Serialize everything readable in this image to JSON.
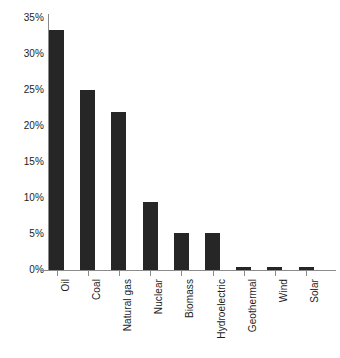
{
  "chart_data": {
    "type": "bar",
    "title": "",
    "subtitle": "",
    "xlabel": "",
    "ylabel": "",
    "categories": [
      "Oil",
      "Coal",
      "Natural gas",
      "Nuclear",
      "Biomass",
      "Hydroelectric",
      "Geothermal",
      "Wind",
      "Solar"
    ],
    "values": [
      33.3,
      25.0,
      22.0,
      9.5,
      5.1,
      5.1,
      0.4,
      0.35,
      0.35
    ],
    "value_suffix": "%",
    "ylim": [
      0,
      35
    ],
    "ytick_values": [
      0,
      5,
      10,
      15,
      20,
      25,
      30,
      35
    ],
    "ytick_labels": [
      "0%",
      "5%",
      "10%",
      "15%",
      "20%",
      "25%",
      "30%",
      "35%"
    ],
    "grid": false,
    "legend": null,
    "legend_position": "none",
    "annotations": [],
    "bar_color": "#262626",
    "axis_color": "#8a8a8a",
    "text_color": "#1d1d1d",
    "background_color": "#ffffff",
    "xtick_label_rotation": 90
  }
}
